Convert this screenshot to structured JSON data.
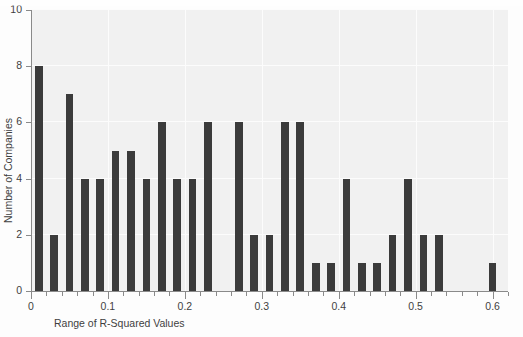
{
  "chart_data": {
    "type": "bar",
    "title": "",
    "xlabel": "Range of R-Squared Values",
    "ylabel": "Number of Companies",
    "xlim": [
      0,
      0.62
    ],
    "ylim": [
      0,
      10
    ],
    "grid": true,
    "legend": null,
    "bar_color": "#3b3b3b",
    "plot_background": "#f1f1f1",
    "axis_color": "#8a8a8a",
    "y_ticks": [
      0,
      2,
      4,
      6,
      8,
      10
    ],
    "y_tick_labels": [
      "0",
      "2",
      "4",
      "6",
      "8",
      "10"
    ],
    "x_major_ticks": [
      0,
      0.1,
      0.2,
      0.3,
      0.4,
      0.5,
      0.6
    ],
    "x_major_tick_labels": [
      "0",
      "0.1",
      "0.2",
      "0.3",
      "0.4",
      "0.5",
      "0.6"
    ],
    "x_minor_tick_step": 0.02,
    "bin_width": 0.01,
    "x": [
      0.01,
      0.03,
      0.05,
      0.07,
      0.09,
      0.11,
      0.13,
      0.15,
      0.17,
      0.19,
      0.21,
      0.23,
      0.27,
      0.29,
      0.31,
      0.33,
      0.35,
      0.37,
      0.39,
      0.41,
      0.43,
      0.45,
      0.47,
      0.49,
      0.51,
      0.53,
      0.6
    ],
    "values": [
      8,
      2,
      7,
      4,
      4,
      5,
      5,
      4,
      6,
      4,
      4,
      6,
      6,
      2,
      2,
      6,
      6,
      1,
      1,
      4,
      1,
      1,
      2,
      4,
      2,
      2,
      1
    ],
    "bars": [
      {
        "x": 0.01,
        "value": 8
      },
      {
        "x": 0.03,
        "value": 2
      },
      {
        "x": 0.05,
        "value": 7
      },
      {
        "x": 0.07,
        "value": 4
      },
      {
        "x": 0.09,
        "value": 4
      },
      {
        "x": 0.11,
        "value": 5
      },
      {
        "x": 0.13,
        "value": 5
      },
      {
        "x": 0.15,
        "value": 4
      },
      {
        "x": 0.17,
        "value": 6
      },
      {
        "x": 0.19,
        "value": 4
      },
      {
        "x": 0.21,
        "value": 4
      },
      {
        "x": 0.23,
        "value": 6
      },
      {
        "x": 0.27,
        "value": 6
      },
      {
        "x": 0.29,
        "value": 2
      },
      {
        "x": 0.31,
        "value": 2
      },
      {
        "x": 0.33,
        "value": 6
      },
      {
        "x": 0.35,
        "value": 6
      },
      {
        "x": 0.37,
        "value": 1
      },
      {
        "x": 0.39,
        "value": 1
      },
      {
        "x": 0.41,
        "value": 4
      },
      {
        "x": 0.43,
        "value": 1
      },
      {
        "x": 0.45,
        "value": 1
      },
      {
        "x": 0.47,
        "value": 2
      },
      {
        "x": 0.49,
        "value": 4
      },
      {
        "x": 0.51,
        "value": 2
      },
      {
        "x": 0.53,
        "value": 2
      },
      {
        "x": 0.6,
        "value": 1
      }
    ]
  }
}
